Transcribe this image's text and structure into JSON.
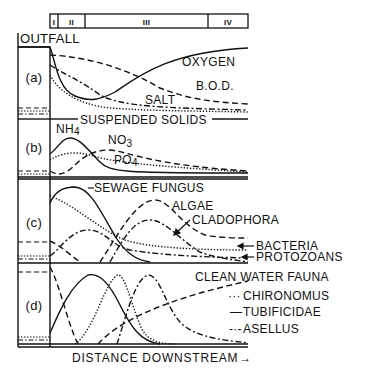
{
  "figure": {
    "outfall_label": "OUTFALL",
    "x_axis_label": "DISTANCE DOWNSTREAM",
    "x_axis_arrow": "→",
    "zones": [
      "I",
      "II",
      "III",
      "IV"
    ]
  },
  "panels": [
    {
      "id": "a",
      "label": "(a)",
      "curves": [
        {
          "name": "OXYGEN",
          "style": "solid"
        },
        {
          "name": "B.O.D.",
          "style": "dashed"
        },
        {
          "name": "SALT",
          "style": "dash-dot"
        },
        {
          "name": "SUSPENDED SOLIDS",
          "style": "dotted"
        }
      ]
    },
    {
      "id": "b",
      "label": "(b)",
      "curves": [
        {
          "name": "NH",
          "sub": "4",
          "style": "solid"
        },
        {
          "name": "NO",
          "sub": "3",
          "style": "dashed"
        },
        {
          "name": "PO",
          "sub": "4",
          "style": "dotted"
        }
      ]
    },
    {
      "id": "c",
      "label": "(c)",
      "curves": [
        {
          "name": "SEWAGE FUNGUS",
          "style": "solid"
        },
        {
          "name": "ALGAE",
          "style": "dashed"
        },
        {
          "name": "CLADOPHORA",
          "style": "dash-dot"
        },
        {
          "name": "BACTERIA",
          "style": "dotted"
        },
        {
          "name": "PROTOZOANS",
          "style": "dash-dot"
        }
      ]
    },
    {
      "id": "d",
      "label": "(d)",
      "curves": [
        {
          "name": "CLEAN WATER FAUNA",
          "style": "dashed"
        },
        {
          "name": "CHIRONOMUS",
          "style": "dotted"
        },
        {
          "name": "TUBIFICIDAE",
          "style": "solid"
        },
        {
          "name": "ASELLUS",
          "style": "dash-dot"
        }
      ]
    }
  ],
  "legend_keys": {
    "chironomus": "···",
    "tubificidae": "—",
    "asellus": "-·-"
  }
}
